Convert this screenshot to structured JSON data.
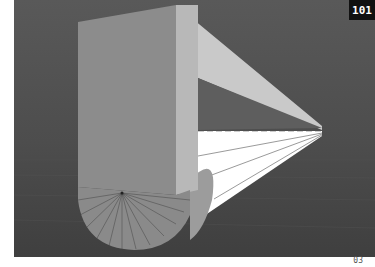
{
  "figure": {
    "badge": "101",
    "page_number": "03",
    "colors": {
      "background": "#505050",
      "floor": "#4a4a4a",
      "front_face": "#8a8a8a",
      "side_face": "#bdbdbd",
      "top_face": "#c8c8c8",
      "beam": "#ffffff",
      "badge_bg": "#111111"
    }
  }
}
